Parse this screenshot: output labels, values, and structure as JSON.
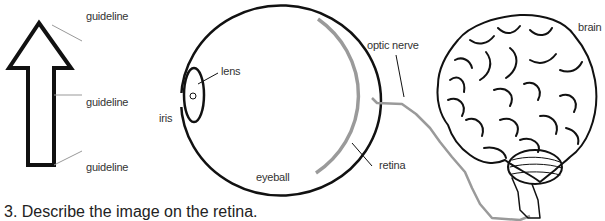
{
  "arrow_panel": {
    "guidelines": [
      {
        "label": "guideline"
      },
      {
        "label": "guideline"
      },
      {
        "label": "guideline"
      }
    ]
  },
  "eye_panel": {
    "labels": {
      "lens": "lens",
      "iris": "iris",
      "eyeball": "eyeball",
      "retina": "retina",
      "optic_nerve": "optic nerve"
    }
  },
  "brain_panel": {
    "label": "brain"
  },
  "caption": {
    "text": "3.   Describe the image on the retina."
  },
  "colors": {
    "outline": "#111111",
    "retina": "#9a9a9a",
    "nerve": "#9a9a9a",
    "guideline": "#999999",
    "label": "#333333"
  }
}
